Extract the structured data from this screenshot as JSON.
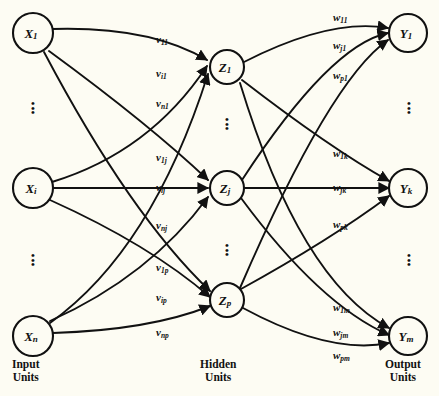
{
  "diagram": {
    "background_color": "#fdfcf3",
    "ink_color": "#111111",
    "layers": {
      "input": {
        "caption_line1": "Input",
        "caption_line2": "Units",
        "nodes": [
          {
            "id": "x1",
            "base": "X",
            "sub": "1",
            "cx": 33,
            "cy": 33,
            "r": 20
          },
          {
            "id": "xi",
            "base": "X",
            "sub": "i",
            "cx": 33,
            "cy": 188,
            "r": 20
          },
          {
            "id": "xn",
            "base": "X",
            "sub": "n",
            "cx": 33,
            "cy": 336,
            "r": 20
          }
        ],
        "ellipsis": [
          {
            "x": 28,
            "y": 101
          },
          {
            "x": 28,
            "y": 253
          }
        ]
      },
      "hidden": {
        "caption_line1": "Hidden",
        "caption_line2": "Units",
        "nodes": [
          {
            "id": "z1",
            "base": "Z",
            "sub": "1",
            "cx": 227,
            "cy": 67,
            "r": 17
          },
          {
            "id": "zj",
            "base": "Z",
            "sub": "j",
            "cx": 227,
            "cy": 188,
            "r": 17
          },
          {
            "id": "zp",
            "base": "Z",
            "sub": "p",
            "cx": 227,
            "cy": 300,
            "r": 17
          }
        ],
        "ellipsis": [
          {
            "x": 222,
            "y": 117
          },
          {
            "x": 222,
            "y": 243
          }
        ]
      },
      "output": {
        "caption_line1": "Output",
        "caption_line2": "Units",
        "nodes": [
          {
            "id": "y1",
            "base": "Y",
            "sub": "1",
            "cx": 408,
            "cy": 33,
            "r": 19
          },
          {
            "id": "yk",
            "base": "Y",
            "sub": "k",
            "cx": 408,
            "cy": 188,
            "r": 19
          },
          {
            "id": "ym",
            "base": "Y",
            "sub": "m",
            "cx": 408,
            "cy": 336,
            "r": 19
          }
        ],
        "ellipsis": [
          {
            "x": 404,
            "y": 101
          },
          {
            "x": 404,
            "y": 253
          }
        ]
      }
    },
    "input_hidden_weights": [
      {
        "id": "v11",
        "base": "v",
        "sub": "11",
        "x": 156,
        "y": 34
      },
      {
        "id": "vi1",
        "base": "v",
        "sub": "i1",
        "x": 156,
        "y": 68
      },
      {
        "id": "vn1",
        "base": "v",
        "sub": "n1",
        "x": 156,
        "y": 98
      },
      {
        "id": "v1j",
        "base": "v",
        "sub": "1j",
        "x": 156,
        "y": 152
      },
      {
        "id": "vij",
        "base": "v",
        "sub": "ij",
        "x": 156,
        "y": 185
      },
      {
        "id": "vnj",
        "base": "v",
        "sub": "nj",
        "x": 156,
        "y": 220
      },
      {
        "id": "v1p",
        "base": "v",
        "sub": "1p",
        "x": 156,
        "y": 262
      },
      {
        "id": "vip",
        "base": "v",
        "sub": "ip",
        "x": 156,
        "y": 292
      },
      {
        "id": "vnp",
        "base": "v",
        "sub": "np",
        "x": 156,
        "y": 327
      }
    ],
    "hidden_output_weights": [
      {
        "id": "w11",
        "base": "w",
        "sub": "11",
        "x": 333,
        "y": 15
      },
      {
        "id": "wj1",
        "base": "w",
        "sub": "j1",
        "x": 333,
        "y": 43
      },
      {
        "id": "wp1",
        "base": "w",
        "sub": "p1",
        "x": 333,
        "y": 73
      },
      {
        "id": "w1k",
        "base": "w",
        "sub": "1k",
        "x": 333,
        "y": 151
      },
      {
        "id": "wjk",
        "base": "w",
        "sub": "jk",
        "x": 333,
        "y": 185
      },
      {
        "id": "wpk",
        "base": "w",
        "sub": "pk",
        "x": 333,
        "y": 222
      },
      {
        "id": "w1m",
        "base": "w",
        "sub": "1m",
        "x": 333,
        "y": 305
      },
      {
        "id": "wjm",
        "base": "w",
        "sub": "jm",
        "x": 333,
        "y": 330
      },
      {
        "id": "wpm",
        "base": "w",
        "sub": "pm",
        "x": 333,
        "y": 352
      }
    ],
    "captions": [
      {
        "id": "input-caption",
        "x": 12,
        "y": 358
      },
      {
        "id": "hidden-caption",
        "x": 200,
        "y": 358
      },
      {
        "id": "output-caption",
        "x": 385,
        "y": 358
      }
    ]
  }
}
